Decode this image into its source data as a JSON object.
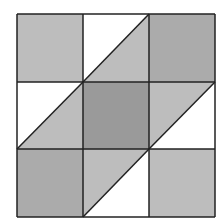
{
  "diagram": {
    "grid": {
      "x": [
        17,
        83,
        149,
        215
      ],
      "y": [
        14,
        82,
        149,
        217
      ]
    },
    "colors": {
      "background": "#ffffff",
      "stroke": "#222222",
      "light": "#bdbdbd",
      "medium": "#ababab",
      "dark": "#9a9a9a",
      "white": "#ffffff"
    },
    "cells": [
      {
        "row": 0,
        "col": 0,
        "fill": "light",
        "type": "square"
      },
      {
        "row": 0,
        "col": 1,
        "type": "split",
        "diagonal": "bottom-left-to-top-right",
        "upper_left": "white",
        "lower_right": "light"
      },
      {
        "row": 0,
        "col": 2,
        "fill": "medium",
        "type": "square"
      },
      {
        "row": 1,
        "col": 0,
        "type": "split",
        "diagonal": "bottom-left-to-top-right",
        "upper_left": "white",
        "lower_right": "light"
      },
      {
        "row": 1,
        "col": 1,
        "fill": "dark",
        "type": "square"
      },
      {
        "row": 1,
        "col": 2,
        "type": "split",
        "diagonal": "bottom-left-to-top-right",
        "upper_left": "light",
        "lower_right": "white"
      },
      {
        "row": 2,
        "col": 0,
        "fill": "medium",
        "type": "square"
      },
      {
        "row": 2,
        "col": 1,
        "type": "split",
        "diagonal": "bottom-left-to-top-right",
        "upper_left": "light",
        "lower_right": "white"
      },
      {
        "row": 2,
        "col": 2,
        "fill": "light",
        "type": "square"
      }
    ]
  }
}
